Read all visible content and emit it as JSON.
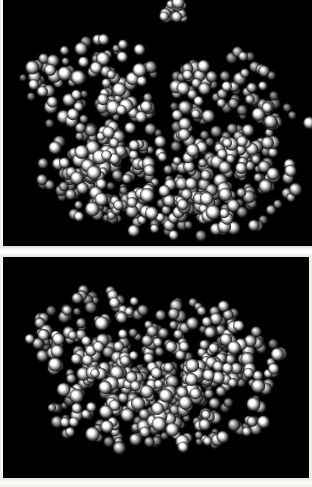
{
  "figure": {
    "background_color": "#f4f4f2",
    "panel_background_color": "#000000",
    "rendering_style": "CPK space-filling spheres, grayscale shaded",
    "panel_count": 2
  },
  "panels": [
    {
      "id": "panel-top",
      "label": "top-panel",
      "x": 3,
      "y": 0,
      "width": 309,
      "height": 246,
      "background_color": "#000000",
      "description": "Two-lobed macromolecule with a deep V-shaped central cleft; small detached sphere cluster floating above the main body.",
      "sphere_color_light": "#ffffff",
      "sphere_color_mid": "#9a9a9a",
      "sphere_color_dark": "#1a1a1a"
    },
    {
      "id": "panel-bottom",
      "label": "bottom-panel",
      "x": 3,
      "y": 257,
      "width": 306,
      "height": 221,
      "background_color": "#000000",
      "description": "Same macromolecule rotated; compact two-lobed mass with shallow central groove, no detached cluster.",
      "sphere_color_light": "#ffffff",
      "sphere_color_mid": "#9a9a9a",
      "sphere_color_dark": "#1a1a1a"
    }
  ],
  "separators": {
    "gap_band": {
      "y": 246,
      "height": 11,
      "color": "#ffffff"
    },
    "bottom_band": {
      "y": 478,
      "height": 9,
      "color": "#f5f5f2"
    },
    "left_band": {
      "x": 0,
      "width": 3,
      "color": "#f2f2ee"
    },
    "right_band": {
      "x": 309,
      "width": 3,
      "color": "#f0f0ec"
    }
  },
  "chart_data": {
    "type": "scatter",
    "xlabel": "",
    "ylabel": "",
    "series": [
      {
        "name": "top-panel-main-body",
        "note": "Dense sphere packing forming two lobes separated by a cleft",
        "sphere_count": 520,
        "regions": [
          {
            "name": "upper-left-lobe",
            "cx": 95,
            "cy": 90,
            "rx": 62,
            "ry": 55,
            "density": 1.0
          },
          {
            "name": "left-arm-extension",
            "cx": 40,
            "cy": 78,
            "rx": 26,
            "ry": 22,
            "density": 0.7
          },
          {
            "name": "right-lobe",
            "cx": 225,
            "cy": 105,
            "rx": 58,
            "ry": 52,
            "density": 1.0
          },
          {
            "name": "right-arm-extension",
            "cx": 282,
            "cy": 130,
            "rx": 26,
            "ry": 26,
            "density": 0.6
          },
          {
            "name": "lower-bridge",
            "cx": 165,
            "cy": 175,
            "rx": 110,
            "ry": 52,
            "density": 1.0
          },
          {
            "name": "lower-left-mass",
            "cx": 95,
            "cy": 175,
            "rx": 58,
            "ry": 48,
            "density": 0.95
          },
          {
            "name": "lower-right-mass",
            "cx": 235,
            "cy": 185,
            "rx": 62,
            "ry": 46,
            "density": 0.95
          },
          {
            "name": "bottom-tail",
            "cx": 170,
            "cy": 215,
            "rx": 70,
            "ry": 22,
            "density": 0.8
          }
        ],
        "detached_cluster": {
          "name": "floating-cluster",
          "cx": 174,
          "cy": 12,
          "rx": 13,
          "ry": 10,
          "sphere_count": 14
        }
      },
      {
        "name": "bottom-panel-main-body",
        "note": "Rotated view, single compact mass with shallow groove",
        "sphere_count": 540,
        "regions": [
          {
            "name": "upper-left-lobe",
            "cx": 95,
            "cy": 85,
            "rx": 60,
            "ry": 52,
            "density": 1.0
          },
          {
            "name": "left-arm-extension",
            "cx": 42,
            "cy": 88,
            "rx": 24,
            "ry": 22,
            "density": 0.7
          },
          {
            "name": "upper-right-lobe",
            "cx": 205,
            "cy": 95,
            "rx": 58,
            "ry": 50,
            "density": 1.0
          },
          {
            "name": "right-arm-extension",
            "cx": 262,
            "cy": 112,
            "rx": 28,
            "ry": 26,
            "density": 0.65
          },
          {
            "name": "central-mass",
            "cx": 150,
            "cy": 130,
            "rx": 90,
            "ry": 48,
            "density": 1.0
          },
          {
            "name": "lower-left-mass",
            "cx": 108,
            "cy": 165,
            "rx": 58,
            "ry": 45,
            "density": 0.95
          },
          {
            "name": "lower-right-mass",
            "cx": 215,
            "cy": 160,
            "rx": 62,
            "ry": 46,
            "density": 0.95
          },
          {
            "name": "bottom-tail",
            "cx": 160,
            "cy": 192,
            "rx": 72,
            "ry": 22,
            "density": 0.8
          }
        ],
        "detached_cluster": null
      }
    ],
    "legend_position": "none",
    "grid": false
  }
}
